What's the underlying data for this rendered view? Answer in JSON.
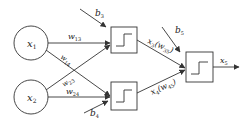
{
  "diagram": {
    "type": "neural-network",
    "stroke_color": "#333333",
    "background": "#ffffff",
    "inputs": [
      {
        "id": "x1",
        "label": "x",
        "sub": "1"
      },
      {
        "id": "x2",
        "label": "x",
        "sub": "2"
      }
    ],
    "hidden_nodes": [
      {
        "id": "n3",
        "activation": "step"
      },
      {
        "id": "n4",
        "activation": "step"
      }
    ],
    "output_node": {
      "id": "n5",
      "activation": "step"
    },
    "weights": {
      "w13": {
        "label": "w",
        "sub": "13"
      },
      "w14": {
        "label": "w",
        "sub": "14"
      },
      "w23": {
        "label": "w",
        "sub": "23"
      },
      "w24": {
        "label": "w",
        "sub": "24"
      }
    },
    "biases": {
      "b3": {
        "label": "b",
        "sub": "3"
      },
      "b4": {
        "label": "b",
        "sub": "4"
      },
      "b5": {
        "label": "b",
        "sub": "5"
      }
    },
    "hidden_outputs": {
      "x3": {
        "label": "x",
        "sub": "3",
        "weight_label": "w",
        "weight_sub": "35"
      },
      "x4": {
        "label": "x",
        "sub": "4",
        "weight_label": "w",
        "weight_sub": "45"
      }
    },
    "output": {
      "label": "x",
      "sub": "5"
    }
  }
}
